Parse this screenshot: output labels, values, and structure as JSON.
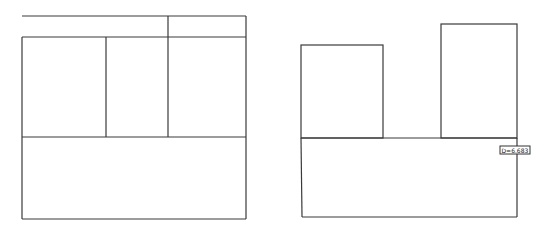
{
  "diagram": {
    "left_layout": {
      "name": "Left partition layout",
      "regions": [
        "top-strip",
        "middle-left",
        "middle-center",
        "middle-right",
        "bottom"
      ]
    },
    "right_layout": {
      "name": "Right partition layout",
      "regions": [
        "left-tower",
        "right-tower",
        "bottom"
      ],
      "measurement_label": "D=6.683"
    }
  }
}
